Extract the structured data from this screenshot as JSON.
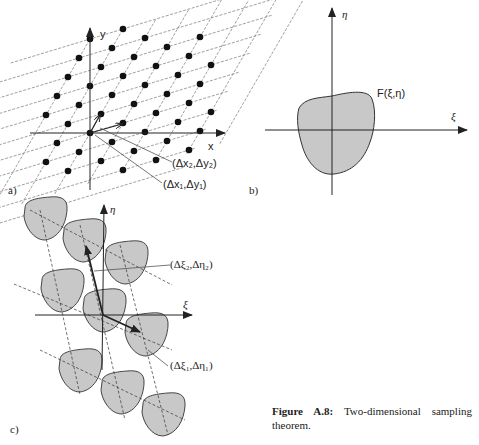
{
  "figure": {
    "caption_label": "Figure A.8:",
    "caption_text": "Two-dimensional sampling theorem.",
    "colors": {
      "ink": "#222222",
      "fill": "#c8c8c8",
      "grid": "#666666"
    }
  },
  "panel_a": {
    "label": "a)",
    "axis_x": "x",
    "axis_y": "y",
    "vector1_label": "(Δx₁,Δy₁)",
    "vector2_label": "(Δx₂,Δy₂)",
    "origin": [
      90,
      133
    ],
    "v1": [
      33,
      -10
    ],
    "v2": [
      11,
      -19
    ]
  },
  "panel_b": {
    "label": "b)",
    "axis_x": "ξ",
    "axis_y": "η",
    "function_label": "F(ξ,η)"
  },
  "panel_c": {
    "label": "c)",
    "axis_x": "ξ",
    "axis_y": "η",
    "vector1_label": "(Δξ₁,Δη₁)",
    "vector2_label": "(Δξ₂,Δη₂)"
  }
}
